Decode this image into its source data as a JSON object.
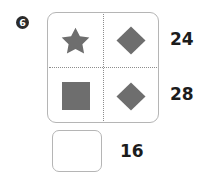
{
  "problem": {
    "number": "6",
    "badge_name": "problem-number-badge"
  },
  "colors": {
    "shape_fill": "#6e6e6e",
    "card_border": "#b5b5b5",
    "divider": "#8d8d8d",
    "text": "#1c1c1c",
    "badge_background": "#2b2b2b",
    "badge_text": "#ffffff",
    "page_background": "#ffffff"
  },
  "grid": {
    "rows": [
      {
        "cells": [
          {
            "shape": "star",
            "shape_label": "star-shape"
          },
          {
            "shape": "diamond",
            "shape_label": "diamond-shape"
          }
        ],
        "sum": "24"
      },
      {
        "cells": [
          {
            "shape": "square",
            "shape_label": "square-shape"
          },
          {
            "shape": "diamond",
            "shape_label": "diamond-shape"
          }
        ],
        "sum": "28"
      }
    ]
  },
  "answer": {
    "box_value": "",
    "box_placeholder": "",
    "column_sum": "16"
  }
}
